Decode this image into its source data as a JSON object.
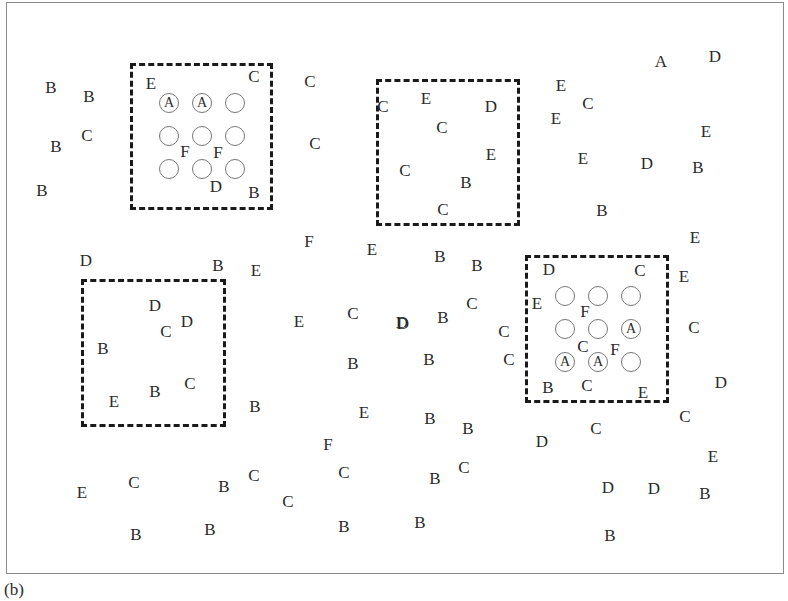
{
  "caption": "(b)",
  "boxes": [
    {
      "id": "top-left",
      "x": 130,
      "y": 63,
      "w": 143,
      "h": 147
    },
    {
      "id": "top-middle",
      "x": 376,
      "y": 79,
      "w": 144,
      "h": 147
    },
    {
      "id": "bottom-left",
      "x": 81,
      "y": 279,
      "w": 145,
      "h": 148
    },
    {
      "id": "bottom-right",
      "x": 525,
      "y": 255,
      "w": 144,
      "h": 148
    }
  ],
  "circle_grids": [
    {
      "box": "top-left",
      "circles": [
        {
          "x": 169,
          "y": 103,
          "label": "A"
        },
        {
          "x": 202,
          "y": 103,
          "label": "A"
        },
        {
          "x": 235,
          "y": 103,
          "label": ""
        },
        {
          "x": 169,
          "y": 136,
          "label": ""
        },
        {
          "x": 202,
          "y": 136,
          "label": ""
        },
        {
          "x": 235,
          "y": 136,
          "label": ""
        },
        {
          "x": 169,
          "y": 169,
          "label": ""
        },
        {
          "x": 202,
          "y": 169,
          "label": ""
        },
        {
          "x": 235,
          "y": 169,
          "label": ""
        }
      ]
    },
    {
      "box": "bottom-right",
      "circles": [
        {
          "x": 565,
          "y": 296,
          "label": ""
        },
        {
          "x": 598,
          "y": 296,
          "label": ""
        },
        {
          "x": 631,
          "y": 296,
          "label": ""
        },
        {
          "x": 565,
          "y": 329,
          "label": ""
        },
        {
          "x": 598,
          "y": 329,
          "label": ""
        },
        {
          "x": 631,
          "y": 329,
          "label": "A"
        },
        {
          "x": 565,
          "y": 362,
          "label": "A"
        },
        {
          "x": 598,
          "y": 362,
          "label": "A"
        },
        {
          "x": 631,
          "y": 362,
          "label": ""
        }
      ]
    }
  ],
  "letters": [
    {
      "t": "B",
      "x": 51,
      "y": 87
    },
    {
      "t": "B",
      "x": 89,
      "y": 96
    },
    {
      "t": "C",
      "x": 87,
      "y": 135
    },
    {
      "t": "B",
      "x": 56,
      "y": 146
    },
    {
      "t": "B",
      "x": 42,
      "y": 190
    },
    {
      "t": "E",
      "x": 151,
      "y": 83
    },
    {
      "t": "C",
      "x": 254,
      "y": 76
    },
    {
      "t": "F",
      "x": 185,
      "y": 151
    },
    {
      "t": "F",
      "x": 218,
      "y": 152
    },
    {
      "t": "D",
      "x": 216,
      "y": 186
    },
    {
      "t": "B",
      "x": 254,
      "y": 192
    },
    {
      "t": "C",
      "x": 310,
      "y": 81
    },
    {
      "t": "C",
      "x": 315,
      "y": 143
    },
    {
      "t": "C",
      "x": 383,
      "y": 106
    },
    {
      "t": "E",
      "x": 426,
      "y": 98
    },
    {
      "t": "D",
      "x": 491,
      "y": 106
    },
    {
      "t": "C",
      "x": 442,
      "y": 127
    },
    {
      "t": "E",
      "x": 491,
      "y": 154
    },
    {
      "t": "C",
      "x": 405,
      "y": 170
    },
    {
      "t": "B",
      "x": 466,
      "y": 182
    },
    {
      "t": "C",
      "x": 443,
      "y": 209
    },
    {
      "t": "E",
      "x": 561,
      "y": 85
    },
    {
      "t": "C",
      "x": 588,
      "y": 103
    },
    {
      "t": "E",
      "x": 556,
      "y": 118
    },
    {
      "t": "E",
      "x": 583,
      "y": 158
    },
    {
      "t": "D",
      "x": 647,
      "y": 163
    },
    {
      "t": "B",
      "x": 698,
      "y": 167
    },
    {
      "t": "B",
      "x": 602,
      "y": 210
    },
    {
      "t": "A",
      "x": 661,
      "y": 61
    },
    {
      "t": "D",
      "x": 715,
      "y": 56
    },
    {
      "t": "E",
      "x": 706,
      "y": 131
    },
    {
      "t": "E",
      "x": 695,
      "y": 237
    },
    {
      "t": "D",
      "x": 86,
      "y": 260
    },
    {
      "t": "B",
      "x": 218,
      "y": 265
    },
    {
      "t": "E",
      "x": 256,
      "y": 270
    },
    {
      "t": "F",
      "x": 309,
      "y": 241
    },
    {
      "t": "E",
      "x": 372,
      "y": 249
    },
    {
      "t": "D",
      "x": 155,
      "y": 305
    },
    {
      "t": "C",
      "x": 166,
      "y": 331
    },
    {
      "t": "D",
      "x": 187,
      "y": 321
    },
    {
      "t": "B",
      "x": 103,
      "y": 348
    },
    {
      "t": "E",
      "x": 114,
      "y": 401
    },
    {
      "t": "B",
      "x": 155,
      "y": 391
    },
    {
      "t": "C",
      "x": 190,
      "y": 383
    },
    {
      "t": "B",
      "x": 255,
      "y": 406
    },
    {
      "t": "E",
      "x": 299,
      "y": 321
    },
    {
      "t": "C",
      "x": 353,
      "y": 313
    },
    {
      "t": "D",
      "x": 403,
      "y": 323
    },
    {
      "t": "B",
      "x": 443,
      "y": 317
    },
    {
      "t": "C",
      "x": 472,
      "y": 303
    },
    {
      "t": "B",
      "x": 353,
      "y": 363
    },
    {
      "t": "B",
      "x": 429,
      "y": 359
    },
    {
      "t": "E",
      "x": 364,
      "y": 412
    },
    {
      "t": "B",
      "x": 440,
      "y": 256
    },
    {
      "t": "B",
      "x": 477,
      "y": 265
    },
    {
      "t": "C",
      "x": 504,
      "y": 331
    },
    {
      "t": "C",
      "x": 509,
      "y": 359
    },
    {
      "t": "D",
      "x": 402,
      "y": 322
    },
    {
      "t": "D",
      "x": 549,
      "y": 269
    },
    {
      "t": "C",
      "x": 640,
      "y": 270
    },
    {
      "t": "E",
      "x": 537,
      "y": 303
    },
    {
      "t": "F",
      "x": 585,
      "y": 311
    },
    {
      "t": "C",
      "x": 583,
      "y": 346
    },
    {
      "t": "F",
      "x": 615,
      "y": 349
    },
    {
      "t": "B",
      "x": 548,
      "y": 387
    },
    {
      "t": "C",
      "x": 587,
      "y": 385
    },
    {
      "t": "E",
      "x": 643,
      "y": 392
    },
    {
      "t": "E",
      "x": 684,
      "y": 276
    },
    {
      "t": "C",
      "x": 694,
      "y": 327
    },
    {
      "t": "D",
      "x": 721,
      "y": 382
    },
    {
      "t": "C",
      "x": 685,
      "y": 416
    },
    {
      "t": "E",
      "x": 713,
      "y": 456
    },
    {
      "t": "B",
      "x": 430,
      "y": 418
    },
    {
      "t": "B",
      "x": 468,
      "y": 428
    },
    {
      "t": "D",
      "x": 542,
      "y": 441
    },
    {
      "t": "C",
      "x": 596,
      "y": 428
    },
    {
      "t": "C",
      "x": 464,
      "y": 467
    },
    {
      "t": "B",
      "x": 435,
      "y": 478
    },
    {
      "t": "B",
      "x": 420,
      "y": 522
    },
    {
      "t": "D",
      "x": 608,
      "y": 487
    },
    {
      "t": "D",
      "x": 654,
      "y": 488
    },
    {
      "t": "B",
      "x": 705,
      "y": 493
    },
    {
      "t": "B",
      "x": 610,
      "y": 535
    },
    {
      "t": "F",
      "x": 328,
      "y": 444
    },
    {
      "t": "C",
      "x": 344,
      "y": 472
    },
    {
      "t": "C",
      "x": 288,
      "y": 501
    },
    {
      "t": "B",
      "x": 224,
      "y": 486
    },
    {
      "t": "C",
      "x": 254,
      "y": 475
    },
    {
      "t": "B",
      "x": 344,
      "y": 526
    },
    {
      "t": "E",
      "x": 82,
      "y": 492
    },
    {
      "t": "C",
      "x": 134,
      "y": 482
    },
    {
      "t": "B",
      "x": 136,
      "y": 534
    },
    {
      "t": "B",
      "x": 210,
      "y": 529
    }
  ]
}
